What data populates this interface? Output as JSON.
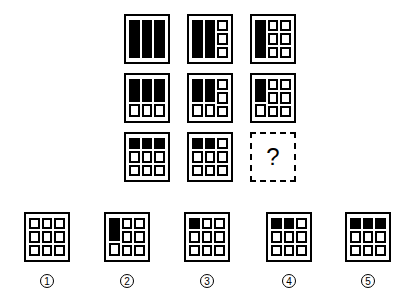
{
  "puzzle": {
    "grid": [
      [
        {
          "cols": [
            [
              1,
              1,
              1
            ],
            [
              1,
              1,
              1
            ],
            [
              1,
              1,
              1
            ]
          ]
        },
        {
          "cols": [
            [
              1,
              1,
              1
            ],
            [
              1,
              1,
              1
            ],
            [
              0,
              0,
              0
            ]
          ]
        },
        {
          "cols": [
            [
              1,
              1,
              1
            ],
            [
              0,
              0,
              0
            ],
            [
              0,
              0,
              0
            ]
          ]
        }
      ],
      [
        {
          "cols": [
            [
              1,
              1,
              0
            ],
            [
              1,
              1,
              0
            ],
            [
              1,
              1,
              0
            ]
          ]
        },
        {
          "cols": [
            [
              1,
              1,
              0
            ],
            [
              1,
              1,
              0
            ],
            [
              0,
              0,
              0
            ]
          ]
        },
        {
          "cols": [
            [
              1,
              1,
              0
            ],
            [
              0,
              0,
              0
            ],
            [
              0,
              0,
              0
            ]
          ]
        }
      ],
      [
        {
          "cols": [
            [
              1,
              0,
              0
            ],
            [
              1,
              0,
              0
            ],
            [
              1,
              0,
              0
            ]
          ]
        },
        {
          "cols": [
            [
              1,
              0,
              0
            ],
            [
              1,
              0,
              0
            ],
            [
              0,
              0,
              0
            ]
          ]
        },
        {
          "unknown": true,
          "label": "?"
        }
      ]
    ],
    "options": [
      {
        "number": "1",
        "cols": [
          [
            0,
            0,
            0
          ],
          [
            0,
            0,
            0
          ],
          [
            0,
            0,
            0
          ]
        ]
      },
      {
        "number": "2",
        "cols": [
          [
            1,
            1,
            0
          ],
          [
            0,
            0,
            0
          ],
          [
            0,
            0,
            0
          ]
        ]
      },
      {
        "number": "3",
        "cols": [
          [
            1,
            0,
            0
          ],
          [
            0,
            0,
            0
          ],
          [
            0,
            0,
            0
          ]
        ]
      },
      {
        "number": "4",
        "cols": [
          [
            1,
            0,
            0
          ],
          [
            1,
            0,
            0
          ],
          [
            0,
            0,
            0
          ]
        ]
      },
      {
        "number": "5",
        "cols": [
          [
            1,
            0,
            0
          ],
          [
            1,
            0,
            0
          ],
          [
            1,
            0,
            0
          ]
        ]
      }
    ],
    "option_labels": [
      "①",
      "②",
      "③",
      "④",
      "⑤"
    ],
    "question_mark": "?"
  }
}
